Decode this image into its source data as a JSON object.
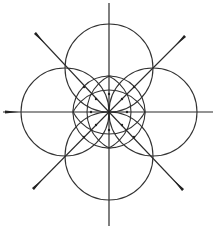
{
  "diagram": {
    "title": "",
    "colors": {
      "stroke": "#2a2a2a",
      "background": "#ffffff"
    },
    "center": {
      "x": 109,
      "y": 112
    },
    "axes": [
      {
        "name": "vertical-axis",
        "x1": 109,
        "y1": 3,
        "x2": 109,
        "y2": 226
      },
      {
        "name": "horizontal-axis",
        "x1": 3,
        "y1": 112,
        "x2": 213,
        "y2": 112
      }
    ],
    "diagonals": [
      {
        "name": "diagonal-nw",
        "x1": 109,
        "y1": 112,
        "x2": 35,
        "y2": 33
      },
      {
        "name": "diagonal-ne",
        "x1": 109,
        "y1": 112,
        "x2": 185,
        "y2": 36
      },
      {
        "name": "diagonal-sw",
        "x1": 109,
        "y1": 112,
        "x2": 33,
        "y2": 189
      },
      {
        "name": "diagonal-se",
        "x1": 109,
        "y1": 112,
        "x2": 183,
        "y2": 190
      }
    ],
    "large_circles": [
      {
        "name": "circle-top",
        "cx": 109,
        "cy": 68,
        "r": 44
      },
      {
        "name": "circle-bottom",
        "cx": 109,
        "cy": 156,
        "r": 44
      },
      {
        "name": "circle-left",
        "cx": 65,
        "cy": 112,
        "r": 44
      },
      {
        "name": "circle-right",
        "cx": 153,
        "cy": 112,
        "r": 44
      }
    ],
    "inner_circle": {
      "name": "inner-circle",
      "cx": 109,
      "cy": 112,
      "r": 36
    },
    "lens_circles": [
      {
        "name": "lens-vertical-left",
        "cx": 127,
        "cy": 112,
        "r": 40
      },
      {
        "name": "lens-vertical-right",
        "cx": 91,
        "cy": 112,
        "r": 40
      },
      {
        "name": "lens-horizontal-top",
        "cx": 109,
        "cy": 130,
        "r": 40
      },
      {
        "name": "lens-horizontal-bottom",
        "cx": 109,
        "cy": 94,
        "r": 40
      }
    ],
    "end_markers": [
      {
        "name": "tip-west",
        "x": 5,
        "y": 112
      },
      {
        "name": "tip-nw",
        "x": 35,
        "y": 33
      },
      {
        "name": "tip-ne",
        "x": 185,
        "y": 36
      },
      {
        "name": "tip-sw",
        "x": 33,
        "y": 189
      },
      {
        "name": "tip-se",
        "x": 183,
        "y": 190
      }
    ]
  }
}
